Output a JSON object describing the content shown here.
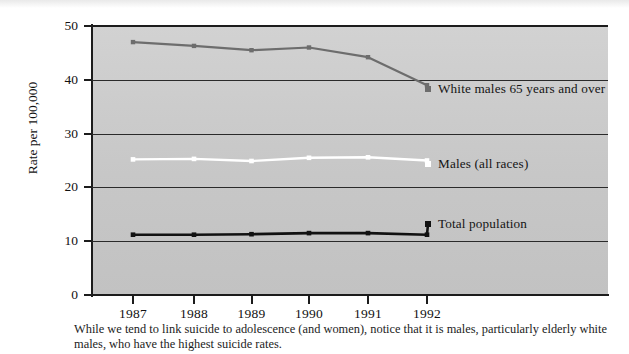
{
  "figure": {
    "caption": "While we tend to link suicide to adolescence (and women), notice that it is males, particularly elderly white males, who have the highest suicide rates."
  },
  "chart_data": {
    "type": "line",
    "title": "",
    "xlabel": "",
    "ylabel": "Rate per 100,000",
    "categories": [
      "1987",
      "1988",
      "1989",
      "1990",
      "1991",
      "1992"
    ],
    "x": [
      1987,
      1988,
      1989,
      1990,
      1991,
      1992
    ],
    "ylim": [
      0,
      50
    ],
    "yticks": [
      0,
      10,
      20,
      30,
      40,
      50
    ],
    "ytick_labels": [
      "0",
      "10",
      "20",
      "30",
      "40",
      "50"
    ],
    "grid": true,
    "grid_axis": "y",
    "legend_position": "inline-right-of-series",
    "plot_background": "#c8c8c8",
    "series": [
      {
        "name": "White males 65 years and over",
        "values": [
          47.0,
          46.3,
          45.5,
          46.0,
          44.2,
          39.0
        ],
        "color": "#6d6d6d",
        "marker": "square"
      },
      {
        "name": "Males (all races)",
        "values": [
          25.2,
          25.3,
          24.9,
          25.5,
          25.6,
          25.0
        ],
        "color": "#ffffff",
        "marker": "square"
      },
      {
        "name": "Total population",
        "values": [
          11.2,
          11.2,
          11.3,
          11.5,
          11.5,
          11.2
        ],
        "color": "#111111",
        "marker": "square"
      }
    ]
  }
}
